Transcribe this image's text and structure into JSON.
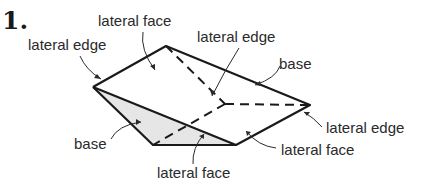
{
  "problem_number": "1.",
  "labels": {
    "lateral_face_top": "lateral face",
    "lateral_edge_left": "lateral edge",
    "lateral_edge_center": "lateral edge",
    "base_right": "base",
    "lateral_edge_right": "lateral edge",
    "lateral_face_right": "lateral face",
    "base_left": "base",
    "lateral_face_bottom": "lateral face"
  },
  "colors": {
    "stroke": "#1a1a1a",
    "base_fill": "#e6e6e6",
    "text": "#2a2a2a"
  }
}
